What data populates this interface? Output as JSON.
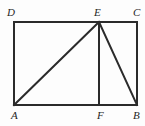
{
  "figure": {
    "kind": "geometry-diagram",
    "background_color": "#fdfdfd",
    "stroke_color": "#2b2b2b",
    "stroke_width": 2,
    "viewbox": "0 0 145 126",
    "points": {
      "A": {
        "x": 14,
        "y": 105
      },
      "B": {
        "x": 137,
        "y": 105
      },
      "C": {
        "x": 137,
        "y": 22
      },
      "D": {
        "x": 14,
        "y": 22
      },
      "E": {
        "x": 99,
        "y": 22
      },
      "F": {
        "x": 99,
        "y": 105
      }
    },
    "segments": [
      {
        "name": "side-DC-top",
        "from": "D",
        "to": "C"
      },
      {
        "name": "side-CB-right",
        "from": "C",
        "to": "B"
      },
      {
        "name": "side-BA-bottom",
        "from": "B",
        "to": "A"
      },
      {
        "name": "side-AD-left",
        "from": "A",
        "to": "D"
      },
      {
        "name": "segment-AE",
        "from": "A",
        "to": "E"
      },
      {
        "name": "segment-EF",
        "from": "E",
        "to": "F"
      },
      {
        "name": "segment-EB",
        "from": "E",
        "to": "B"
      }
    ],
    "labels": [
      {
        "id": "D",
        "text": "D",
        "x": 7,
        "y": 7
      },
      {
        "id": "E",
        "text": "E",
        "x": 94,
        "y": 7
      },
      {
        "id": "C",
        "text": "C",
        "x": 133,
        "y": 7
      },
      {
        "id": "A",
        "text": "A",
        "x": 11,
        "y": 110
      },
      {
        "id": "F",
        "text": "F",
        "x": 97,
        "y": 110
      },
      {
        "id": "B",
        "text": "B",
        "x": 133,
        "y": 110
      }
    ]
  }
}
